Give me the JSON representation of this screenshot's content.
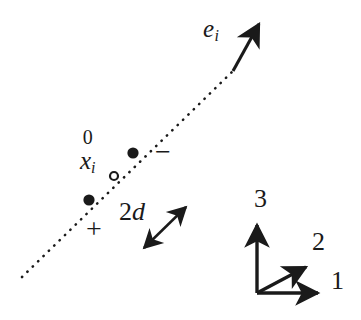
{
  "figure": {
    "name": "fiber-direction-diagram",
    "background_color": "#ffffff",
    "ink_color": "#1a1a1a",
    "width": 361,
    "height": 320
  },
  "labels": {
    "fiber_vector": {
      "base": "e",
      "subscript": "i"
    },
    "reference_position": {
      "superscript": "0",
      "base": "x",
      "subscript": "i"
    },
    "spacing": {
      "number": "2",
      "symbol": "d"
    },
    "plus_sign": "+",
    "minus_sign": "−"
  },
  "axes": {
    "label_1": "1",
    "label_2": "2",
    "label_3": "3",
    "origin": {
      "x": 257,
      "y": 293
    },
    "tips": {
      "axis_1": {
        "x": 325,
        "y": 293
      },
      "axis_2": {
        "x": 313,
        "y": 262
      },
      "axis_3": {
        "x": 257,
        "y": 218
      }
    }
  },
  "geometry": {
    "dotted_line": {
      "x1": 22,
      "y1": 277,
      "x2": 233,
      "y2": 71
    },
    "fiber_arrow": {
      "x1": 233,
      "y1": 71,
      "x2": 263,
      "y2": 18
    },
    "spacing_arrow": {
      "x1": 139,
      "y1": 253,
      "x2": 191,
      "y2": 202
    }
  },
  "markers": [
    {
      "name": "material-point-minus",
      "kind": "filled",
      "x": 133,
      "y": 153,
      "r": 5.6
    },
    {
      "name": "material-point-center",
      "kind": "hollow",
      "x": 114,
      "y": 176,
      "r": 4.2
    },
    {
      "name": "material-point-plus",
      "kind": "filled",
      "x": 89,
      "y": 200,
      "r": 5.6
    }
  ]
}
